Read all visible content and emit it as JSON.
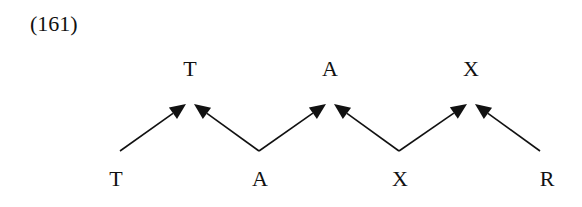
{
  "example_number": "(161)",
  "diagram": {
    "top_labels": [
      {
        "text": "T",
        "x": 190
      },
      {
        "text": "A",
        "x": 330
      },
      {
        "text": "X",
        "x": 471
      }
    ],
    "bottom_labels": [
      {
        "text": "T",
        "x": 116
      },
      {
        "text": "A",
        "x": 260
      },
      {
        "text": "X",
        "x": 400
      },
      {
        "text": "R",
        "x": 547
      }
    ],
    "top_y": 58,
    "bottom_y": 168,
    "apexes": [
      190,
      330,
      471
    ],
    "bottom_vertices": [
      120,
      259,
      399,
      540
    ],
    "apex_y": 104,
    "base_y": 151,
    "edges": [
      {
        "from": "T-bottom",
        "to": "T-top",
        "arrow": true
      },
      {
        "from": "A-bottom",
        "to": "T-top",
        "arrow": true
      },
      {
        "from": "A-bottom",
        "to": "A-top",
        "arrow": true
      },
      {
        "from": "X-bottom",
        "to": "A-top",
        "arrow": true
      },
      {
        "from": "X-bottom",
        "to": "X-top",
        "arrow": true
      },
      {
        "from": "R-bottom",
        "to": "X-top",
        "arrow": true
      }
    ]
  }
}
